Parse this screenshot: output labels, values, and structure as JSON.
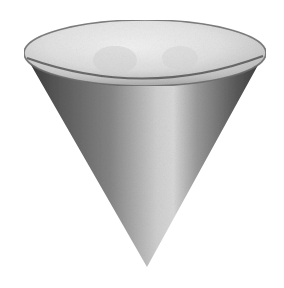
{
  "image": {
    "subject": "cone",
    "description": "Shaded 3D cone pointing downward with an open elliptical top",
    "width": 284,
    "height": 288,
    "background_color": "#ffffff"
  },
  "cone": {
    "rim": {
      "cx": 145,
      "cy": 53,
      "rx": 121,
      "ry": 33,
      "fill_light": "#eeeeee",
      "fill_mid": "#d6d6d6",
      "fill_dark": "#b4b4b4",
      "outline_color": "#5a5a5a"
    },
    "body": {
      "left_point": [
        27,
        60
      ],
      "right_point": [
        263,
        58
      ],
      "tip_point": [
        147,
        267
      ],
      "shade_edge": "#3c3c3c",
      "shade_mid": "#7a7a7a",
      "shade_highlight": "#d8d8d8"
    }
  }
}
